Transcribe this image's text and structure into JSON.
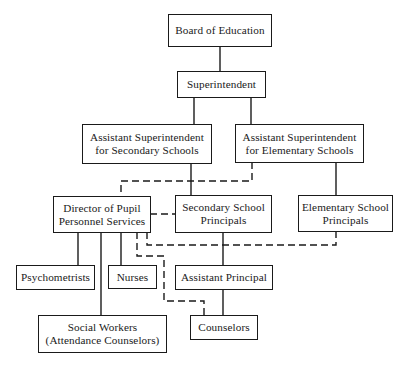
{
  "chart": {
    "type": "org-chart",
    "nodes": {
      "board": "Board of Education",
      "superintendent": "Superintendent",
      "asst_sup_secondary": "Assistant Superintendent\nfor Secondary Schools",
      "asst_sup_elementary": "Assistant Superintendent\nfor Elementary Schools",
      "director_pupil": "Director of Pupil\nPersonnel Services",
      "secondary_principals": "Secondary School\nPrincipals",
      "elementary_principals": "Elementary School\nPrincipals",
      "psychometrists": "Psychometrists",
      "nurses": "Nurses",
      "assistant_principal": "Assistant Principal",
      "social_workers": "Social Workers\n(Attendance Counselors)",
      "counselors": "Counselors"
    },
    "solid_links": [
      [
        "board",
        "superintendent"
      ],
      [
        "superintendent",
        "asst_sup_secondary"
      ],
      [
        "superintendent",
        "asst_sup_elementary"
      ],
      [
        "asst_sup_secondary",
        "secondary_principals"
      ],
      [
        "asst_sup_elementary",
        "elementary_principals"
      ],
      [
        "director_pupil",
        "psychometrists"
      ],
      [
        "director_pupil",
        "nurses"
      ],
      [
        "director_pupil",
        "social_workers"
      ],
      [
        "secondary_principals",
        "assistant_principal"
      ],
      [
        "assistant_principal",
        "counselors"
      ]
    ],
    "dashed_links": [
      [
        "asst_sup_elementary",
        "director_pupil"
      ],
      [
        "director_pupil",
        "secondary_principals"
      ],
      [
        "director_pupil",
        "elementary_principals"
      ],
      [
        "director_pupil",
        "counselors"
      ]
    ],
    "colors": {
      "line": "#1a1a1a",
      "background": "#ffffff"
    }
  }
}
